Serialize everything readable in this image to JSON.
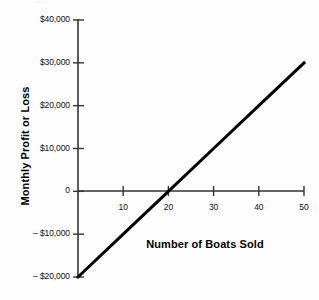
{
  "chart_data": {
    "type": "line",
    "title": "",
    "xlabel": "Number of Boats Sold",
    "ylabel": "Monthly Profit or Loss",
    "xlim": [
      0,
      50
    ],
    "ylim": [
      -20000,
      40000
    ],
    "grid": false,
    "legend": "none",
    "x_ticks": [
      10,
      20,
      30,
      40,
      50
    ],
    "x_tick_labels": [
      "10",
      "20",
      "30",
      "40",
      "50"
    ],
    "y_ticks": [
      40000,
      30000,
      20000,
      10000,
      0,
      -10000,
      -20000
    ],
    "y_tick_labels": [
      "$40,000",
      "$30,000",
      "$20,000",
      "$10,000",
      "0",
      "– $10,000",
      "– $20,000"
    ],
    "series": [
      {
        "name": "Monthly profit or loss",
        "x": [
          0,
          10,
          20,
          30,
          40,
          50
        ],
        "values": [
          -20000,
          -10000,
          0,
          10000,
          20000,
          30000
        ],
        "color": "#000000",
        "line_width": 3
      }
    ],
    "annotations": {
      "break_even_units": 20,
      "break_even_value": 0,
      "slope_per_unit": 1000,
      "intercept": -20000
    },
    "axis_color": "#333333",
    "text_color": "#111111",
    "background": "#fdfdfd",
    "top_artifact": "——"
  }
}
